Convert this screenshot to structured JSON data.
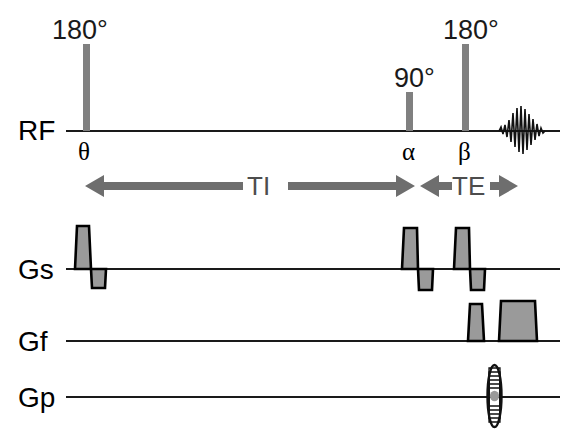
{
  "figure": {
    "background_color": "#ffffff",
    "pulse_color": "#808080",
    "gradient_fill_color": "#9a9a9a",
    "gradient_stroke_color": "#000000",
    "axis_color": "#1a1a1a",
    "arrow_color": "#6e6e6e"
  },
  "channels": [
    {
      "id": "rf",
      "label": "RF"
    },
    {
      "id": "gs",
      "label": "Gs"
    },
    {
      "id": "gf",
      "label": "Gf"
    },
    {
      "id": "gp",
      "label": "Gp"
    }
  ],
  "rf_pulses": [
    {
      "id": "inversion",
      "flip_label": "180°",
      "phase_label": "θ"
    },
    {
      "id": "excitation",
      "flip_label": "90°",
      "phase_label": "α"
    },
    {
      "id": "refocus",
      "flip_label": "180°",
      "phase_label": "β"
    }
  ],
  "echo": {
    "id": "spin-echo-signal",
    "name": "echo-waveform"
  },
  "intervals": [
    {
      "id": "ti",
      "label": "TI",
      "description": "inversion time"
    },
    {
      "id": "te",
      "label": "TE",
      "description": "echo time"
    }
  ],
  "gradients": {
    "gs": {
      "label": "Gs",
      "name": "slice-select-gradient",
      "lobes": [
        {
          "polarity": "positive",
          "id": "gs-lobe-1"
        },
        {
          "polarity": "negative",
          "id": "gs-lobe-2"
        },
        {
          "polarity": "positive",
          "id": "gs-lobe-3"
        },
        {
          "polarity": "negative",
          "id": "gs-lobe-4"
        },
        {
          "polarity": "positive",
          "id": "gs-lobe-5"
        },
        {
          "polarity": "negative",
          "id": "gs-lobe-6"
        }
      ]
    },
    "gf": {
      "label": "Gf",
      "name": "frequency-encode-gradient",
      "lobes": [
        {
          "polarity": "positive",
          "id": "gf-lobe-1"
        },
        {
          "polarity": "positive",
          "id": "gf-lobe-2"
        }
      ]
    },
    "gp": {
      "label": "Gp",
      "name": "phase-encode-gradient",
      "lobes": [
        {
          "polarity": "stepped",
          "id": "gp-lobe-1"
        }
      ]
    }
  }
}
